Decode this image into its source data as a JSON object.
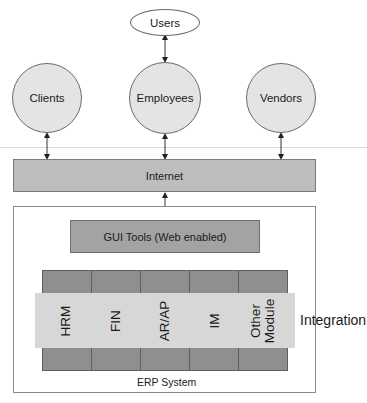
{
  "top": {
    "users": "Users"
  },
  "actors": [
    {
      "label": "Clients"
    },
    {
      "label": "Employees"
    },
    {
      "label": "Vendors"
    }
  ],
  "internet": {
    "label": "Internet"
  },
  "erp": {
    "gui_label": "GUI Tools (Web enabled)",
    "system_label": "ERP System",
    "modules": [
      {
        "label": "HRM"
      },
      {
        "label": "FIN"
      },
      {
        "label": "AR/AP"
      },
      {
        "label": "IM"
      },
      {
        "label": "Other\nModule"
      }
    ],
    "integration_label": "Integration"
  },
  "colors": {
    "actor_fill": "#e4e4e4",
    "internet_fill": "#bdbdbd",
    "gui_fill": "#a3a3a3",
    "module_block_fill": "#8f8f8f",
    "integration_fill": "#d7d7d7"
  }
}
